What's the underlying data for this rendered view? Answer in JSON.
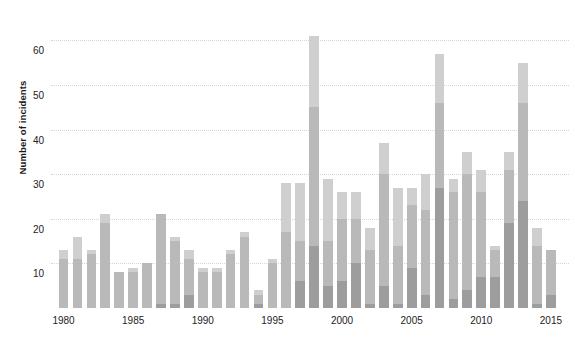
{
  "chart_data": {
    "type": "bar",
    "stacked": true,
    "title": "",
    "subtitle": "",
    "xlabel": "",
    "ylabel": "Number of incidents",
    "ylim": [
      0,
      65
    ],
    "ytick_values": [
      10,
      20,
      30,
      40,
      50,
      60
    ],
    "ytick_labels": [
      "10",
      "20",
      "30",
      "40",
      "50",
      "60"
    ],
    "xtick_values": [
      1980,
      1985,
      1990,
      1995,
      2000,
      2005,
      2010,
      2015
    ],
    "xtick_labels": [
      "1980",
      "1985",
      "1990",
      "1995",
      "2000",
      "2005",
      "2010",
      "2015"
    ],
    "grid": "horizontal-dotted",
    "legend": "none",
    "colors": {
      "series_1": "#9d9d9d",
      "series_2": "#b9b9b9",
      "series_3": "#cfcfcf",
      "series_4": "#e6e6e6",
      "gridline": "#d6d6d6",
      "text": "#222222",
      "background": "#ffffff"
    },
    "categories": [
      1980,
      1981,
      1982,
      1983,
      1984,
      1985,
      1986,
      1987,
      1988,
      1989,
      1990,
      1991,
      1992,
      1993,
      1994,
      1995,
      1996,
      1997,
      1998,
      1999,
      2000,
      2001,
      2002,
      2003,
      2004,
      2005,
      2006,
      2007,
      2008,
      2009,
      2010,
      2011,
      2012,
      2013,
      2014,
      2015
    ],
    "series": [
      {
        "name": "series_1",
        "color": "#9d9d9d",
        "values": [
          0,
          0,
          0,
          0,
          0,
          0,
          0,
          1,
          1,
          3,
          0,
          0,
          0,
          0,
          1,
          0,
          0,
          6,
          14,
          5,
          6,
          10,
          1,
          5,
          1,
          9,
          3,
          27,
          2,
          4,
          7,
          7,
          19,
          24,
          1,
          3
        ]
      },
      {
        "name": "series_2",
        "color": "#b9b9b9",
        "values": [
          11,
          11,
          12,
          19,
          8,
          8,
          10,
          20,
          14,
          8,
          8,
          8,
          12,
          16,
          2,
          10,
          17,
          9,
          31,
          10,
          14,
          10,
          12,
          25,
          13,
          14,
          19,
          19,
          24,
          26,
          19,
          6,
          12,
          22,
          13,
          10
        ]
      },
      {
        "name": "series_3",
        "color": "#cfcfcf",
        "values": [
          2,
          5,
          1,
          2,
          0,
          1,
          0,
          0,
          1,
          2,
          1,
          1,
          1,
          1,
          1,
          1,
          11,
          13,
          16,
          14,
          6,
          6,
          5,
          7,
          13,
          4,
          8,
          11,
          3,
          5,
          5,
          1,
          4,
          9,
          4,
          0
        ]
      },
      {
        "name": "series_4",
        "color": "#e6e6e6",
        "values": [
          0,
          0,
          0,
          0,
          0,
          0,
          0,
          0,
          0,
          0,
          0,
          0,
          0,
          0,
          0,
          0,
          0,
          0,
          0,
          0,
          0,
          0,
          0,
          0,
          0,
          0,
          0,
          0,
          0,
          0,
          0,
          0,
          0,
          0,
          0,
          0
        ]
      }
    ],
    "totals": [
      13,
      16,
      13,
      21,
      8,
      9,
      10,
      21,
      16,
      13,
      9,
      9,
      13,
      17,
      4,
      11,
      28,
      28,
      61,
      29,
      26,
      26,
      18,
      37,
      27,
      27,
      30,
      57,
      29,
      35,
      31,
      14,
      35,
      55,
      18,
      13
    ]
  }
}
